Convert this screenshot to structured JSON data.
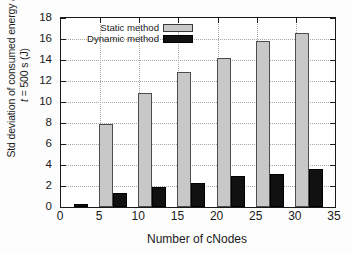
{
  "chart_data": {
    "type": "bar",
    "title": "",
    "xlabel": "Number of cNodes",
    "ylabel_line1": "Std deviation of consumed energy at",
    "ylabel_line2_italic": "t",
    "ylabel_line2_rest": " = 500 s (J)",
    "categories": [
      0,
      5,
      10,
      15,
      20,
      25,
      30
    ],
    "xlim": [
      0,
      35
    ],
    "ylim": [
      0,
      18
    ],
    "xticks": [
      0,
      5,
      10,
      15,
      20,
      25,
      30,
      35
    ],
    "yticks": [
      0,
      2,
      4,
      6,
      8,
      10,
      12,
      14,
      16,
      18
    ],
    "grid": true,
    "legend_position": "top-center",
    "series": [
      {
        "name": "Static method",
        "color": "#c8c8c8",
        "edge_color": "#4d4d4d",
        "values": [
          0.0,
          7.9,
          10.9,
          12.9,
          14.2,
          15.8,
          16.6
        ]
      },
      {
        "name": "Dynamic method",
        "color": "#111111",
        "edge_color": "#000000",
        "values": [
          0.3,
          1.3,
          1.9,
          2.3,
          3.0,
          3.1,
          3.6
        ]
      }
    ]
  },
  "axis": {
    "ytick_labels": [
      "0",
      "2",
      "4",
      "6",
      "8",
      "10",
      "12",
      "14",
      "16",
      "18"
    ],
    "xtick_labels": [
      "0",
      "5",
      "10",
      "15",
      "20",
      "25",
      "30",
      "35"
    ]
  },
  "legend": {
    "items": [
      {
        "label": "Static method",
        "swatch": "static"
      },
      {
        "label": "Dynamic method",
        "swatch": "dynamic"
      }
    ]
  }
}
